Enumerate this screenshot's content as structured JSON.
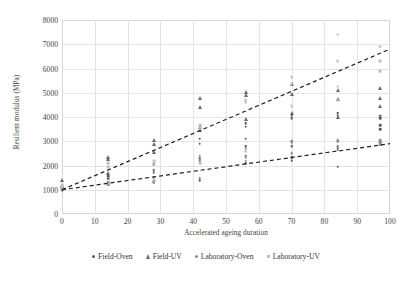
{
  "chart_data": {
    "type": "scatter",
    "title": "",
    "xlabel": "Accelerated ageing duration",
    "ylabel": "Resilient modulus (MPa)",
    "xlim": [
      0,
      100
    ],
    "ylim": [
      0,
      8000
    ],
    "xticks": [
      0,
      10,
      20,
      30,
      40,
      50,
      60,
      70,
      80,
      90,
      100
    ],
    "yticks": [
      0,
      1000,
      2000,
      3000,
      4000,
      5000,
      6000,
      7000,
      8000
    ],
    "grid": true,
    "legend_position": "bottom",
    "series": [
      {
        "name": "Field-Oven",
        "marker": "dot",
        "color": "#5a5a5a",
        "points": [
          [
            0,
            1100
          ],
          [
            0,
            1050
          ],
          [
            0,
            1000
          ],
          [
            14,
            1550
          ],
          [
            14,
            1450
          ],
          [
            14,
            1250
          ],
          [
            14,
            1200
          ],
          [
            28,
            2050
          ],
          [
            28,
            1800
          ],
          [
            28,
            1700
          ],
          [
            28,
            1350
          ],
          [
            28,
            1300
          ],
          [
            42,
            3100
          ],
          [
            42,
            2900
          ],
          [
            42,
            2300
          ],
          [
            42,
            2200
          ],
          [
            42,
            1400
          ],
          [
            56,
            3750
          ],
          [
            56,
            3600
          ],
          [
            56,
            3100
          ],
          [
            56,
            2800
          ],
          [
            56,
            2400
          ],
          [
            56,
            2100
          ],
          [
            70,
            4050
          ],
          [
            70,
            3950
          ],
          [
            70,
            3000
          ],
          [
            70,
            2800
          ],
          [
            70,
            2350
          ],
          [
            70,
            2200
          ],
          [
            84,
            4150
          ],
          [
            84,
            4050
          ],
          [
            84,
            3000
          ],
          [
            84,
            2750
          ],
          [
            84,
            2650
          ],
          [
            84,
            1950
          ],
          [
            97,
            4050
          ],
          [
            97,
            3950
          ],
          [
            97,
            3650
          ],
          [
            97,
            3500
          ],
          [
            97,
            2950
          ],
          [
            97,
            2850
          ]
        ]
      },
      {
        "name": "Field-UV",
        "marker": "triangle",
        "color": "#6b6b6b",
        "points": [
          [
            0,
            1400
          ],
          [
            0,
            1150
          ],
          [
            14,
            2350
          ],
          [
            14,
            2250
          ],
          [
            14,
            1700
          ],
          [
            28,
            3050
          ],
          [
            28,
            2900
          ],
          [
            28,
            2550
          ],
          [
            42,
            4800
          ],
          [
            42,
            4400
          ],
          [
            42,
            3600
          ],
          [
            42,
            3450
          ],
          [
            56,
            5050
          ],
          [
            56,
            4900
          ],
          [
            56,
            3900
          ],
          [
            70,
            5350
          ],
          [
            70,
            4950
          ],
          [
            70,
            4150
          ],
          [
            84,
            5100
          ],
          [
            84,
            4750
          ],
          [
            84,
            4000
          ],
          [
            97,
            5200
          ],
          [
            97,
            4800
          ],
          [
            97,
            4450
          ]
        ]
      },
      {
        "name": "Laboratory-Oven",
        "marker": "dot",
        "color": "#8d8d8d",
        "points": [
          [
            0,
            1050
          ],
          [
            0,
            980
          ],
          [
            14,
            1300
          ],
          [
            14,
            1200
          ],
          [
            28,
            1800
          ],
          [
            28,
            1500
          ],
          [
            28,
            1300
          ],
          [
            42,
            2400
          ],
          [
            42,
            2250
          ],
          [
            42,
            1500
          ],
          [
            56,
            2700
          ],
          [
            56,
            2350
          ],
          [
            56,
            2200
          ],
          [
            70,
            2950
          ],
          [
            70,
            2500
          ],
          [
            70,
            2300
          ],
          [
            84,
            3050
          ],
          [
            84,
            2800
          ],
          [
            84,
            2700
          ],
          [
            97,
            3050
          ],
          [
            97,
            2950
          ],
          [
            97,
            2850
          ]
        ]
      },
      {
        "name": "Laboratory-UV",
        "marker": "square",
        "color": "#bdbdbd",
        "points": [
          [
            0,
            1200
          ],
          [
            0,
            1100
          ],
          [
            14,
            2100
          ],
          [
            14,
            1950
          ],
          [
            14,
            1250
          ],
          [
            28,
            2200
          ],
          [
            28,
            2100
          ],
          [
            28,
            1400
          ],
          [
            42,
            3650
          ],
          [
            42,
            3550
          ],
          [
            42,
            2100
          ],
          [
            56,
            4700
          ],
          [
            56,
            4600
          ],
          [
            56,
            2600
          ],
          [
            70,
            5650
          ],
          [
            70,
            5350
          ],
          [
            70,
            4450
          ],
          [
            84,
            7400
          ],
          [
            84,
            6300
          ],
          [
            84,
            5250
          ],
          [
            84,
            4700
          ],
          [
            97,
            6900
          ],
          [
            97,
            6300
          ],
          [
            97,
            5900
          ]
        ]
      }
    ],
    "trendlines": [
      {
        "name": "upper-trend",
        "style": "dashed",
        "color": "#1f1f1f",
        "x_start": 0,
        "y_start": 1000,
        "x_end": 100,
        "y_end": 6800
      },
      {
        "name": "lower-trend",
        "style": "dashed",
        "color": "#1f1f1f",
        "x_start": 0,
        "y_start": 1000,
        "x_end": 100,
        "y_end": 2900
      }
    ]
  },
  "legend": {
    "items": [
      {
        "label": "Field-Oven",
        "marker": "dot",
        "color": "#5a5a5a"
      },
      {
        "label": "Field-UV",
        "marker": "triangle",
        "color": "#6b6b6b"
      },
      {
        "label": "Laboratory-Oven",
        "marker": "dot",
        "color": "#8d8d8d"
      },
      {
        "label": "Laboratory-UV",
        "marker": "square",
        "color": "#bdbdbd"
      }
    ]
  }
}
